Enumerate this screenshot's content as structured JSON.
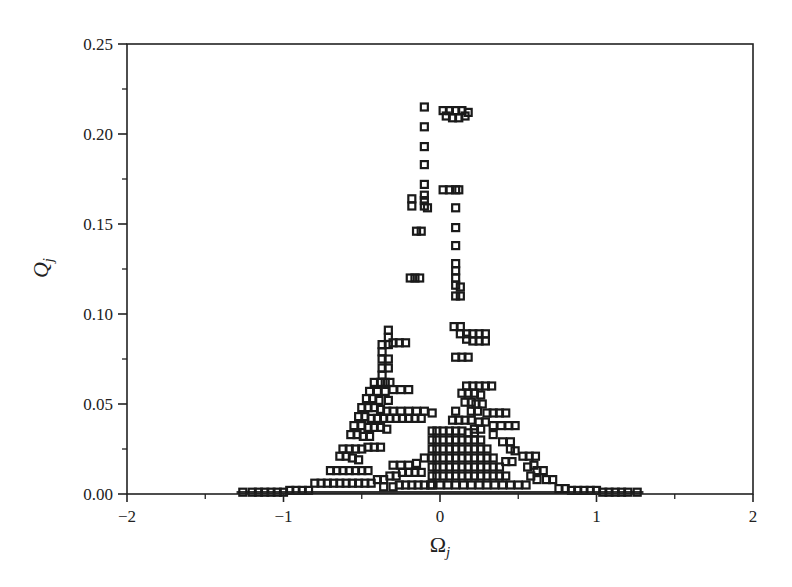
{
  "chart_data": {
    "type": "scatter",
    "title": "",
    "xlabel": "Ω_j",
    "ylabel": "Q_j",
    "xlabel_main": "Ω",
    "xlabel_sub": "j",
    "ylabel_main": "Q",
    "ylabel_sub": "j",
    "xlim": [
      -2,
      2
    ],
    "ylim": [
      0,
      0.25
    ],
    "xticks": [
      -2,
      -1,
      0,
      1,
      2
    ],
    "xtick_labels": [
      "−2",
      "−1",
      "0",
      "1",
      "2"
    ],
    "yticks": [
      0.0,
      0.05,
      0.1,
      0.15,
      0.2,
      0.25
    ],
    "ytick_labels": [
      "0.00",
      "0.05",
      "0.10",
      "0.15",
      "0.20",
      "0.25"
    ],
    "grid": false,
    "legend": null,
    "marker": "open-square",
    "marker_color": "#1a1a1a",
    "series": [
      {
        "name": "Q_j vs Ω_j",
        "points": [
          [
            -0.1,
            0.215
          ],
          [
            -0.1,
            0.204
          ],
          [
            -0.1,
            0.193
          ],
          [
            -0.1,
            0.183
          ],
          [
            -0.1,
            0.172
          ],
          [
            -0.1,
            0.166
          ],
          [
            -0.1,
            0.163
          ],
          [
            -0.1,
            0.16
          ],
          [
            -0.12,
            0.146
          ],
          [
            -0.15,
            0.146
          ],
          [
            -0.18,
            0.164
          ],
          [
            -0.18,
            0.16
          ],
          [
            -0.08,
            0.159
          ],
          [
            0.02,
            0.213
          ],
          [
            0.06,
            0.213
          ],
          [
            0.1,
            0.213
          ],
          [
            0.14,
            0.213
          ],
          [
            0.18,
            0.212
          ],
          [
            0.04,
            0.21
          ],
          [
            0.08,
            0.209
          ],
          [
            0.12,
            0.209
          ],
          [
            0.16,
            0.21
          ],
          [
            0.02,
            0.169
          ],
          [
            0.06,
            0.169
          ],
          [
            0.1,
            0.169
          ],
          [
            0.12,
            0.169
          ],
          [
            0.1,
            0.159
          ],
          [
            0.1,
            0.148
          ],
          [
            0.1,
            0.138
          ],
          [
            0.1,
            0.128
          ],
          [
            0.1,
            0.124
          ],
          [
            0.1,
            0.12
          ],
          [
            0.1,
            0.116
          ],
          [
            0.13,
            0.115
          ],
          [
            0.1,
            0.11
          ],
          [
            0.13,
            0.11
          ],
          [
            -0.19,
            0.12
          ],
          [
            -0.16,
            0.12
          ],
          [
            -0.13,
            0.12
          ],
          [
            0.09,
            0.093
          ],
          [
            0.13,
            0.093
          ],
          [
            0.13,
            0.089
          ],
          [
            0.17,
            0.089
          ],
          [
            0.21,
            0.089
          ],
          [
            0.25,
            0.089
          ],
          [
            0.29,
            0.089
          ],
          [
            0.17,
            0.086
          ],
          [
            0.21,
            0.085
          ],
          [
            0.25,
            0.085
          ],
          [
            0.29,
            0.085
          ],
          [
            0.1,
            0.076
          ],
          [
            0.14,
            0.076
          ],
          [
            0.18,
            0.076
          ],
          [
            -0.33,
            0.091
          ],
          [
            -0.33,
            0.087
          ],
          [
            -0.33,
            0.083
          ],
          [
            -0.3,
            0.084
          ],
          [
            -0.26,
            0.084
          ],
          [
            -0.22,
            0.084
          ],
          [
            -0.37,
            0.083
          ],
          [
            -0.37,
            0.079
          ],
          [
            -0.37,
            0.075
          ],
          [
            -0.33,
            0.075
          ],
          [
            -0.33,
            0.07
          ],
          [
            -0.37,
            0.07
          ],
          [
            -0.37,
            0.066
          ],
          [
            -0.42,
            0.062
          ],
          [
            -0.38,
            0.062
          ],
          [
            -0.35,
            0.062
          ],
          [
            -0.32,
            0.062
          ],
          [
            -0.45,
            0.057
          ],
          [
            -0.4,
            0.057
          ],
          [
            -0.35,
            0.057
          ],
          [
            -0.3,
            0.058
          ],
          [
            -0.25,
            0.058
          ],
          [
            -0.2,
            0.058
          ],
          [
            -0.47,
            0.053
          ],
          [
            -0.43,
            0.053
          ],
          [
            -0.39,
            0.052
          ],
          [
            -0.33,
            0.052
          ],
          [
            -0.5,
            0.048
          ],
          [
            -0.46,
            0.048
          ],
          [
            -0.42,
            0.048
          ],
          [
            -0.38,
            0.047
          ],
          [
            -0.34,
            0.046
          ],
          [
            -0.3,
            0.046
          ],
          [
            -0.25,
            0.046
          ],
          [
            -0.2,
            0.046
          ],
          [
            -0.15,
            0.046
          ],
          [
            -0.1,
            0.046
          ],
          [
            -0.05,
            0.045
          ],
          [
            -0.52,
            0.043
          ],
          [
            -0.48,
            0.043
          ],
          [
            -0.44,
            0.042
          ],
          [
            -0.4,
            0.042
          ],
          [
            -0.36,
            0.042
          ],
          [
            -0.32,
            0.042
          ],
          [
            -0.28,
            0.042
          ],
          [
            -0.24,
            0.042
          ],
          [
            -0.2,
            0.042
          ],
          [
            -0.16,
            0.042
          ],
          [
            -0.12,
            0.042
          ],
          [
            -0.55,
            0.038
          ],
          [
            -0.5,
            0.038
          ],
          [
            -0.46,
            0.037
          ],
          [
            -0.42,
            0.037
          ],
          [
            -0.38,
            0.037
          ],
          [
            -0.34,
            0.036
          ],
          [
            -0.57,
            0.033
          ],
          [
            -0.53,
            0.033
          ],
          [
            -0.49,
            0.032
          ],
          [
            -0.45,
            0.032
          ],
          [
            -0.62,
            0.025
          ],
          [
            -0.58,
            0.025
          ],
          [
            -0.54,
            0.025
          ],
          [
            -0.5,
            0.025
          ],
          [
            -0.46,
            0.026
          ],
          [
            -0.42,
            0.026
          ],
          [
            -0.38,
            0.026
          ],
          [
            -0.64,
            0.021
          ],
          [
            -0.6,
            0.021
          ],
          [
            -0.56,
            0.02
          ],
          [
            -0.52,
            0.019
          ],
          [
            -0.7,
            0.013
          ],
          [
            -0.66,
            0.013
          ],
          [
            -0.62,
            0.013
          ],
          [
            -0.58,
            0.013
          ],
          [
            -0.54,
            0.013
          ],
          [
            -0.5,
            0.013
          ],
          [
            -0.46,
            0.013
          ],
          [
            -0.8,
            0.006
          ],
          [
            -0.76,
            0.006
          ],
          [
            -0.72,
            0.006
          ],
          [
            -0.68,
            0.006
          ],
          [
            -0.64,
            0.006
          ],
          [
            -0.6,
            0.006
          ],
          [
            -0.56,
            0.006
          ],
          [
            -0.52,
            0.006
          ],
          [
            -0.48,
            0.006
          ],
          [
            -0.44,
            0.006
          ],
          [
            -0.4,
            0.008
          ],
          [
            -0.36,
            0.008
          ],
          [
            -0.32,
            0.01
          ],
          [
            -0.28,
            0.01
          ],
          [
            -0.24,
            0.012
          ],
          [
            -0.2,
            0.012
          ],
          [
            -0.16,
            0.012
          ],
          [
            -0.12,
            0.012
          ],
          [
            -0.36,
            0.004
          ],
          [
            -0.3,
            0.004
          ],
          [
            -0.26,
            0.005
          ],
          [
            -0.22,
            0.005
          ],
          [
            -0.18,
            0.005
          ],
          [
            -0.14,
            0.005
          ],
          [
            -0.1,
            0.005
          ],
          [
            -0.06,
            0.005
          ],
          [
            -0.3,
            0.016
          ],
          [
            -0.25,
            0.016
          ],
          [
            -0.2,
            0.016
          ],
          [
            -0.15,
            0.017
          ],
          [
            -0.1,
            0.02
          ],
          [
            -0.05,
            0.035
          ],
          [
            -0.02,
            0.035
          ],
          [
            0.02,
            0.035
          ],
          [
            0.06,
            0.035
          ],
          [
            0.1,
            0.035
          ],
          [
            0.14,
            0.035
          ],
          [
            0.18,
            0.034
          ],
          [
            0.22,
            0.034
          ],
          [
            -0.05,
            0.03
          ],
          [
            -0.02,
            0.03
          ],
          [
            0.02,
            0.03
          ],
          [
            0.06,
            0.03
          ],
          [
            0.1,
            0.03
          ],
          [
            0.14,
            0.03
          ],
          [
            0.18,
            0.03
          ],
          [
            0.22,
            0.03
          ],
          [
            0.26,
            0.03
          ],
          [
            -0.05,
            0.025
          ],
          [
            -0.02,
            0.025
          ],
          [
            0.02,
            0.025
          ],
          [
            0.06,
            0.025
          ],
          [
            0.1,
            0.025
          ],
          [
            0.14,
            0.025
          ],
          [
            0.18,
            0.025
          ],
          [
            0.22,
            0.025
          ],
          [
            0.26,
            0.025
          ],
          [
            0.3,
            0.025
          ],
          [
            -0.05,
            0.02
          ],
          [
            -0.02,
            0.02
          ],
          [
            0.02,
            0.02
          ],
          [
            0.06,
            0.02
          ],
          [
            0.1,
            0.02
          ],
          [
            0.14,
            0.02
          ],
          [
            0.18,
            0.02
          ],
          [
            0.22,
            0.02
          ],
          [
            0.26,
            0.02
          ],
          [
            0.3,
            0.02
          ],
          [
            0.34,
            0.02
          ],
          [
            -0.05,
            0.015
          ],
          [
            -0.02,
            0.015
          ],
          [
            0.02,
            0.015
          ],
          [
            0.06,
            0.015
          ],
          [
            0.1,
            0.015
          ],
          [
            0.14,
            0.015
          ],
          [
            0.18,
            0.015
          ],
          [
            0.22,
            0.015
          ],
          [
            0.26,
            0.015
          ],
          [
            0.3,
            0.015
          ],
          [
            0.34,
            0.015
          ],
          [
            0.38,
            0.015
          ],
          [
            -0.05,
            0.01
          ],
          [
            -0.02,
            0.01
          ],
          [
            0.02,
            0.01
          ],
          [
            0.06,
            0.01
          ],
          [
            0.1,
            0.01
          ],
          [
            0.14,
            0.01
          ],
          [
            0.18,
            0.01
          ],
          [
            0.22,
            0.01
          ],
          [
            0.26,
            0.01
          ],
          [
            0.3,
            0.01
          ],
          [
            0.34,
            0.01
          ],
          [
            0.38,
            0.01
          ],
          [
            0.42,
            0.01
          ],
          [
            -0.05,
            0.005
          ],
          [
            0.0,
            0.005
          ],
          [
            0.05,
            0.005
          ],
          [
            0.1,
            0.005
          ],
          [
            0.15,
            0.005
          ],
          [
            0.2,
            0.005
          ],
          [
            0.25,
            0.005
          ],
          [
            0.3,
            0.005
          ],
          [
            0.35,
            0.005
          ],
          [
            0.4,
            0.005
          ],
          [
            0.45,
            0.005
          ],
          [
            0.5,
            0.005
          ],
          [
            0.55,
            0.005
          ],
          [
            0.17,
            0.06
          ],
          [
            0.21,
            0.06
          ],
          [
            0.25,
            0.06
          ],
          [
            0.29,
            0.06
          ],
          [
            0.33,
            0.06
          ],
          [
            0.14,
            0.056
          ],
          [
            0.18,
            0.056
          ],
          [
            0.22,
            0.056
          ],
          [
            0.26,
            0.055
          ],
          [
            0.16,
            0.051
          ],
          [
            0.2,
            0.051
          ],
          [
            0.23,
            0.05
          ],
          [
            0.27,
            0.05
          ],
          [
            0.1,
            0.046
          ],
          [
            0.2,
            0.046
          ],
          [
            0.24,
            0.046
          ],
          [
            0.3,
            0.045
          ],
          [
            0.34,
            0.045
          ],
          [
            0.38,
            0.045
          ],
          [
            0.42,
            0.045
          ],
          [
            0.08,
            0.041
          ],
          [
            0.12,
            0.041
          ],
          [
            0.16,
            0.041
          ],
          [
            0.2,
            0.041
          ],
          [
            0.25,
            0.04
          ],
          [
            0.29,
            0.04
          ],
          [
            0.22,
            0.036
          ],
          [
            0.26,
            0.036
          ],
          [
            0.34,
            0.038
          ],
          [
            0.39,
            0.038
          ],
          [
            0.44,
            0.038
          ],
          [
            0.48,
            0.038
          ],
          [
            0.34,
            0.033
          ],
          [
            0.4,
            0.029
          ],
          [
            0.45,
            0.029
          ],
          [
            0.45,
            0.025
          ],
          [
            0.48,
            0.024
          ],
          [
            0.53,
            0.021
          ],
          [
            0.57,
            0.021
          ],
          [
            0.61,
            0.021
          ],
          [
            0.56,
            0.015
          ],
          [
            0.6,
            0.016
          ],
          [
            0.42,
            0.018
          ],
          [
            0.46,
            0.018
          ],
          [
            0.62,
            0.013
          ],
          [
            0.66,
            0.013
          ],
          [
            0.68,
            0.008
          ],
          [
            0.72,
            0.008
          ],
          [
            0.58,
            0.01
          ],
          [
            0.62,
            0.008
          ],
          [
            0.76,
            0.003
          ],
          [
            0.8,
            0.003
          ],
          [
            0.84,
            0.002
          ],
          [
            0.88,
            0.002
          ],
          [
            0.92,
            0.002
          ],
          [
            0.96,
            0.002
          ],
          [
            1.0,
            0.002
          ],
          [
            1.04,
            0.001
          ],
          [
            1.08,
            0.001
          ],
          [
            1.12,
            0.001
          ],
          [
            1.16,
            0.001
          ],
          [
            1.2,
            0.001
          ],
          [
            1.26,
            0.001
          ],
          [
            -0.84,
            0.002
          ],
          [
            -0.88,
            0.002
          ],
          [
            -0.92,
            0.002
          ],
          [
            -0.96,
            0.002
          ],
          [
            -1.0,
            0.001
          ],
          [
            -1.04,
            0.001
          ],
          [
            -1.08,
            0.001
          ],
          [
            -1.12,
            0.001
          ],
          [
            -1.16,
            0.001
          ],
          [
            -1.2,
            0.001
          ],
          [
            -1.26,
            0.001
          ]
        ]
      }
    ]
  }
}
